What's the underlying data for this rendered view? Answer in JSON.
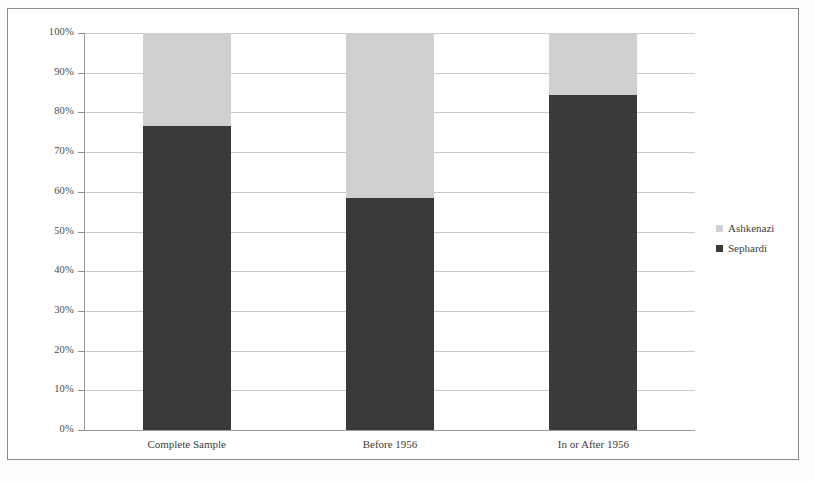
{
  "chart_data": {
    "type": "bar",
    "subtype": "100% stacked column",
    "title": "",
    "xlabel": "",
    "ylabel": "",
    "categories": [
      "Complete Sample",
      "Before 1956",
      "In or After 1956"
    ],
    "series": [
      {
        "name": "Sephardi",
        "color": "#3a3a3a",
        "values": [
          76.5,
          58.5,
          84.5
        ]
      },
      {
        "name": "Ashkenazi",
        "color": "#d0d0d0",
        "values": [
          23.5,
          41.5,
          15.5
        ]
      }
    ],
    "ylim": [
      0,
      100
    ],
    "ytick_values": [
      0,
      10,
      20,
      30,
      40,
      50,
      60,
      70,
      80,
      90,
      100
    ],
    "ytick_labels": [
      "0%",
      "10%",
      "20%",
      "30%",
      "40%",
      "50%",
      "60%",
      "70%",
      "80%",
      "90%",
      "100%"
    ],
    "grid": true,
    "grid_axis": "y",
    "legend_position": "right",
    "legend_entries": [
      "Ashkenazi",
      "Sephardi"
    ]
  },
  "axes": {
    "y_labels": [
      "100%",
      "90%",
      "80%",
      "70%",
      "60%",
      "50%",
      "40%",
      "30%",
      "20%",
      "10%",
      "0%"
    ],
    "x_labels": [
      "Complete Sample",
      "Before 1956",
      "In or After 1956"
    ]
  },
  "legend": {
    "items": [
      {
        "label": "Ashkenazi",
        "color": "#d0d0d0"
      },
      {
        "label": "Sephardi",
        "color": "#3a3a3a"
      }
    ]
  },
  "colors": {
    "ashkenazi": "#d0d0d0",
    "sephardi": "#3a3a3a",
    "gridline": "#c9c9c9",
    "frame": "#8a8a8a"
  }
}
